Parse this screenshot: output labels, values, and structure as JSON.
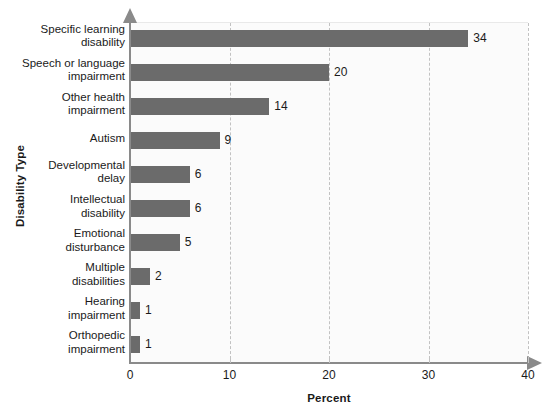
{
  "chart_data": {
    "type": "bar",
    "orientation": "horizontal",
    "title": "",
    "xlabel": "Percent",
    "ylabel": "Disability Type",
    "xlim": [
      0,
      40
    ],
    "xticks": [
      0,
      10,
      20,
      30,
      40
    ],
    "grid": "vertical-dashed",
    "legend": "none",
    "bar_color": "#6b6b6b",
    "plot_background": "#fbfbfb",
    "axis_color": "#8a8a8a",
    "gridline_color": "#c2c2c2",
    "categories": [
      "Specific learning disability",
      "Speech or language impairment",
      "Other health impairment",
      "Autism",
      "Developmental delay",
      "Intellectual disability",
      "Emotional disturbance",
      "Multiple disabilities",
      "Hearing impairment",
      "Orthopedic impairment"
    ],
    "values": [
      34,
      20,
      14,
      9,
      6,
      6,
      5,
      2,
      1,
      1
    ],
    "value_labels": [
      "34",
      "20",
      "14",
      "9",
      "6",
      "6",
      "5",
      "2",
      "1",
      "1"
    ],
    "category_lines": [
      [
        "Specific learning",
        "disability"
      ],
      [
        "Speech or language",
        "impairment"
      ],
      [
        "Other health",
        "impairment"
      ],
      [
        "Autism"
      ],
      [
        "Developmental",
        "delay"
      ],
      [
        "Intellectual",
        "disability"
      ],
      [
        "Emotional",
        "disturbance"
      ],
      [
        "Multiple",
        "disabilities"
      ],
      [
        "Hearing",
        "impairment"
      ],
      [
        "Orthopedic",
        "impairment"
      ]
    ]
  },
  "axes": {
    "x_title": "Percent",
    "y_title": "Disability Type",
    "x_tick_labels": [
      "0",
      "10",
      "20",
      "30",
      "40"
    ]
  }
}
